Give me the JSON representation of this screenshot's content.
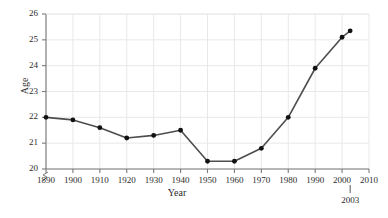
{
  "chart_data": {
    "type": "line",
    "title": "",
    "xlabel": "Year",
    "ylabel": "Age",
    "x": [
      1890,
      1900,
      1910,
      1920,
      1930,
      1940,
      1950,
      1960,
      1970,
      1980,
      1990,
      2000,
      2003
    ],
    "values": [
      22.0,
      21.9,
      21.6,
      21.2,
      21.3,
      21.5,
      20.3,
      20.3,
      20.8,
      22.0,
      23.9,
      25.1,
      25.35
    ],
    "series": [
      {
        "name": "Age",
        "values": [
          22.0,
          21.9,
          21.6,
          21.2,
          21.3,
          21.5,
          20.3,
          20.3,
          20.8,
          22.0,
          23.9,
          25.1,
          25.35
        ]
      }
    ],
    "xlim": [
      1890,
      2010
    ],
    "ylim": [
      20,
      26
    ],
    "xticks": [
      1890,
      1900,
      1910,
      1920,
      1930,
      1940,
      1950,
      1960,
      1970,
      1980,
      1990,
      2000,
      2010
    ],
    "xtick_labels": [
      "1890",
      "1900",
      "1910",
      "1920",
      "1930",
      "1940",
      "1950",
      "1960",
      "1970",
      "1980",
      "1990",
      "2000",
      "2010"
    ],
    "yticks": [
      20,
      21,
      22,
      23,
      24,
      25,
      26
    ],
    "ytick_labels": [
      "20",
      "21",
      "22",
      "23",
      "24",
      "25",
      "26"
    ],
    "grid": true,
    "legend": false,
    "y_axis_break": true,
    "annotations": [
      {
        "text": "2003",
        "x": 2003,
        "position": "below-axis"
      }
    ],
    "line_color": "#4d4d4d",
    "marker_color": "#111111",
    "grid_color": "#e8e8e8",
    "axis_color": "#7a7a7a"
  },
  "axis": {
    "y_title": "Age",
    "x_title": "Year"
  },
  "annotation": {
    "label_2003": "2003"
  }
}
